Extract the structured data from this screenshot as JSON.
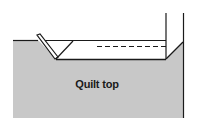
{
  "diagram": {
    "label": "Quilt top",
    "colors": {
      "fill": "#c8c8c8",
      "stroke": "#1a1a1a",
      "background": "#ffffff"
    }
  }
}
